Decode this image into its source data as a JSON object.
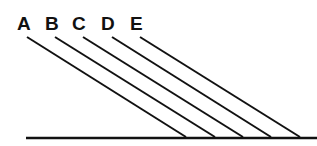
{
  "diagram": {
    "colors": {
      "stroke": "#111111",
      "background": "#ffffff"
    },
    "baseline": {
      "x1": 26,
      "y1": 138,
      "x2": 317,
      "y2": 138
    },
    "rays": [
      {
        "label": "A",
        "label_x": 17,
        "label_y": 30,
        "x1": 27,
        "y1": 37,
        "x2": 186,
        "y2": 137
      },
      {
        "label": "B",
        "label_x": 45,
        "label_y": 30,
        "x1": 55,
        "y1": 37,
        "x2": 215,
        "y2": 137
      },
      {
        "label": "C",
        "label_x": 72,
        "label_y": 30,
        "x1": 83,
        "y1": 37,
        "x2": 243,
        "y2": 137
      },
      {
        "label": "D",
        "label_x": 101,
        "label_y": 30,
        "x1": 112,
        "y1": 37,
        "x2": 271,
        "y2": 137
      },
      {
        "label": "E",
        "label_x": 130,
        "label_y": 30,
        "x1": 140,
        "y1": 37,
        "x2": 300,
        "y2": 137
      }
    ]
  }
}
